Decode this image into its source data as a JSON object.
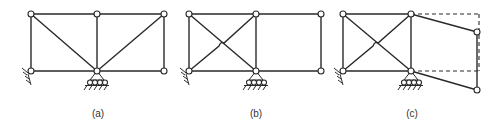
{
  "figure": {
    "panels": [
      {
        "id": "a",
        "label": "(a)",
        "description": "Truss with two diagonals meeting at bottom-middle support"
      },
      {
        "id": "b",
        "label": "(b)",
        "description": "Truss with crossed diagonals in left bay, open right bay"
      },
      {
        "id": "c",
        "label": "(c)",
        "description": "Same as (b) with right bay shown as mechanism displacement (dashed original position)"
      }
    ],
    "colors": {
      "line": "#2a2a2a",
      "node_fill": "#ffffff",
      "background": "#ffffff"
    }
  }
}
